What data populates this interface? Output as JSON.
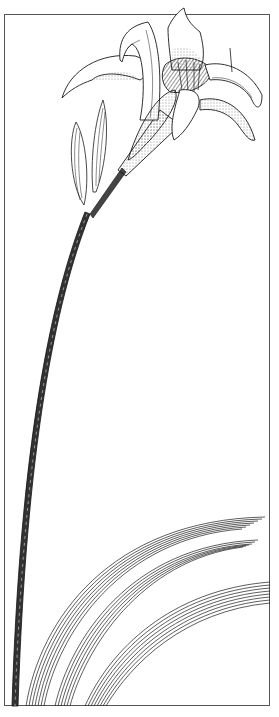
{
  "illustration": {
    "subject": "Daylily plant — flower, buds, scape and leaves (botanical line drawing)",
    "ink_color": "#1a1a1a",
    "paper_color": "#ffffff",
    "frame_color": "#555555"
  },
  "caption": {
    "text": ""
  }
}
